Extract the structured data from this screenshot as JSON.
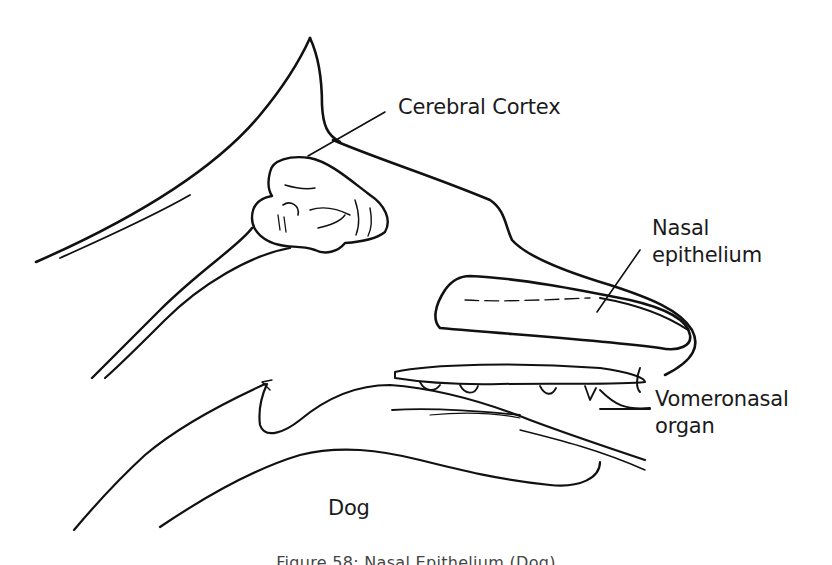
{
  "figure": {
    "caption": "Figure 58: Nasal Epithelium (Dog)",
    "subject_label": "Dog",
    "style": "hand-drawn sagittal sketch of dog head",
    "ink_color": "#111111",
    "background_color": "#ffffff"
  },
  "labels": {
    "cerebral_cortex": "Cerebral Cortex",
    "nasal_epithelium_line1": "Nasal",
    "nasal_epithelium_line2": "epithelium",
    "vomeronasal_line1": "Vomeronasal",
    "vomeronasal_line2": "organ"
  }
}
